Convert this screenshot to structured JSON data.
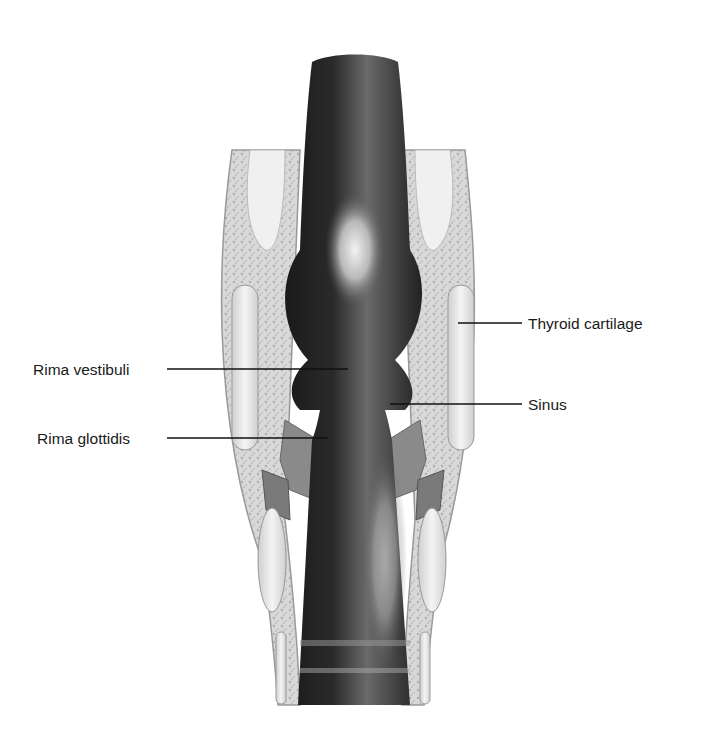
{
  "diagram": {
    "labels": [
      {
        "id": "thyroid",
        "text": "Thyroid cartilage",
        "side": "right"
      },
      {
        "id": "rima_vestibuli",
        "text": "Rima vestibuli",
        "side": "left"
      },
      {
        "id": "sinus",
        "text": "Sinus",
        "side": "right"
      },
      {
        "id": "rima_glottidis",
        "text": "Rima glottidis",
        "side": "left"
      }
    ]
  }
}
